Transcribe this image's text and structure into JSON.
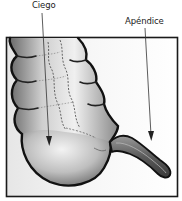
{
  "diagram": {
    "labels": [
      {
        "id": "ciego",
        "text": "Ciego",
        "points_to": "cecum"
      },
      {
        "id": "apendice",
        "text": "Apéndice",
        "points_to": "appendix"
      }
    ],
    "colors": {
      "outline": "#111111",
      "frame": "#1a1a1a",
      "shade_dark": "#5a5a5a",
      "shade_light": "#e8e8e8",
      "background": "#ffffff",
      "arrow": "#333333"
    }
  }
}
